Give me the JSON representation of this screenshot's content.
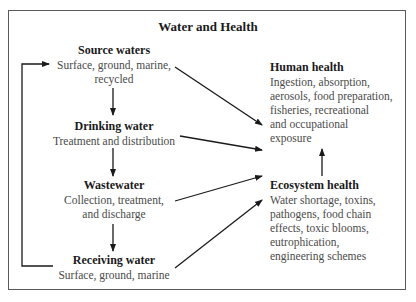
{
  "diagram": {
    "title": "Water and Health",
    "nodes": {
      "source": {
        "heading": "Source waters",
        "lines": [
          "Surface, ground, marine,",
          "recycled"
        ]
      },
      "drinking": {
        "heading": "Drinking water",
        "lines": [
          "Treatment and distribution"
        ]
      },
      "wastewater": {
        "heading": "Wastewater",
        "lines": [
          "Collection, treatment,",
          "and discharge"
        ]
      },
      "receiving": {
        "heading": "Receiving water",
        "lines": [
          "Surface, ground, marine"
        ]
      },
      "human": {
        "heading": "Human health",
        "lines": [
          "Ingestion, absorption,",
          "aerosols, food preparation,",
          "fisheries, recreational",
          "and occupational",
          "exposure"
        ]
      },
      "ecosystem": {
        "heading": "Ecosystem health",
        "lines": [
          "Water shortage, toxins,",
          "pathogens, food chain",
          "effects, toxic blooms,",
          "eutrophication,",
          "engineering schemes"
        ]
      }
    },
    "edges": [
      {
        "from": "Source waters",
        "to": "Drinking water"
      },
      {
        "from": "Drinking water",
        "to": "Wastewater"
      },
      {
        "from": "Wastewater",
        "to": "Receiving water"
      },
      {
        "from": "Receiving water",
        "to": "Source waters",
        "type": "loop"
      },
      {
        "from": "Source waters",
        "to": "Human health"
      },
      {
        "from": "Drinking water",
        "to": "Human health"
      },
      {
        "from": "Wastewater",
        "to": "Ecosystem health"
      },
      {
        "from": "Receiving water",
        "to": "Ecosystem health"
      },
      {
        "from": "Ecosystem health",
        "to": "Human health"
      }
    ],
    "colors": {
      "line": "#1a1a1a",
      "frame": "#5a5a5a",
      "heading": "#1a1a1a",
      "body": "#4a4a4a"
    }
  }
}
